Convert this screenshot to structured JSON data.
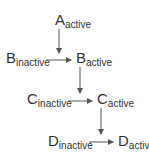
{
  "diagram": {
    "type": "signaling-cascade",
    "nodes": [
      {
        "id": "A_active",
        "letter": "A",
        "state": "active"
      },
      {
        "id": "B_inactive",
        "letter": "B",
        "state": "inactive"
      },
      {
        "id": "B_active",
        "letter": "B",
        "state": "active"
      },
      {
        "id": "C_inactive",
        "letter": "C",
        "state": "inactive"
      },
      {
        "id": "C_active",
        "letter": "C",
        "state": "active"
      },
      {
        "id": "D_inactive",
        "letter": "D",
        "state": "inactive"
      },
      {
        "id": "D_active",
        "letter": "D",
        "state": "active"
      }
    ],
    "edges": [
      {
        "from": "A_active",
        "to": "B_conversion",
        "kind": "catalyzes"
      },
      {
        "from": "B_inactive",
        "to": "B_active",
        "kind": "conversion"
      },
      {
        "from": "B_active",
        "to": "C_conversion",
        "kind": "catalyzes"
      },
      {
        "from": "C_inactive",
        "to": "C_active",
        "kind": "conversion"
      },
      {
        "from": "C_active",
        "to": "D_conversion",
        "kind": "catalyzes"
      },
      {
        "from": "D_inactive",
        "to": "D_active",
        "kind": "conversion"
      }
    ],
    "colors": {
      "text": "#333333",
      "arrow": "#555555",
      "background": "#ffffff"
    }
  }
}
